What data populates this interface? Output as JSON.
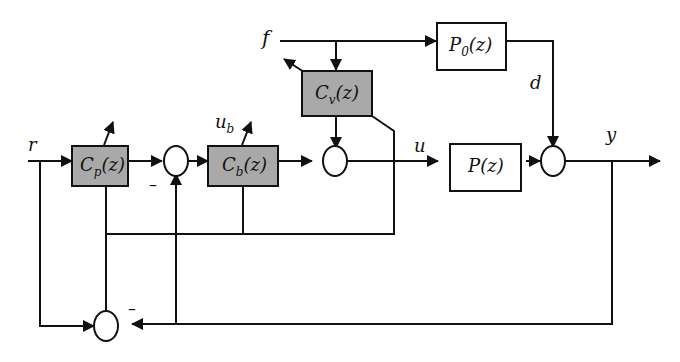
{
  "diagram": {
    "type": "control block diagram",
    "colors": {
      "controller_fill": "#a9a9a9",
      "line": "#111111",
      "plant_fill": "#ffffff"
    },
    "signals": {
      "r": "r",
      "f": "f",
      "u_b_main": "u",
      "u_b_sub": "b",
      "u": "u",
      "d": "d",
      "y": "y"
    },
    "blocks": {
      "cp": {
        "main": "C",
        "sub": "p",
        "arg": "(z)",
        "style": "gray"
      },
      "cb": {
        "main": "C",
        "sub": "b",
        "arg": "(z)",
        "style": "gray"
      },
      "cv": {
        "main": "C",
        "sub": "v",
        "arg": "(z)",
        "style": "gray"
      },
      "p0": {
        "main": "P",
        "sub": "0",
        "arg": "(z)",
        "style": "white"
      },
      "p": {
        "main": "P",
        "sub": "",
        "arg": "(z)",
        "style": "white"
      }
    },
    "minus_signs": {
      "sum1": "–",
      "sum_bottom": "–"
    }
  }
}
